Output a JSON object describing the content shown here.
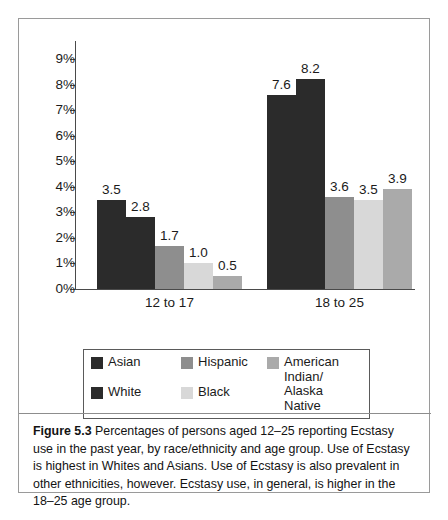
{
  "figure": {
    "caption_label": "Figure 5.3",
    "caption_text": " Percentages of persons aged 12–25 reporting Ecstasy use in the past year, by race/ethnicity and age group. Use of Ecstasy is highest in Whites and Asians. Use of Ecstasy is also prevalent in other ethnicities, however. Ecstasy use, in general, is higher in the 18–25 age group."
  },
  "chart_data": {
    "type": "bar",
    "title": "",
    "xlabel": "",
    "ylabel": "",
    "ylim": [
      0,
      9
    ],
    "ytick_labels": [
      "9%",
      "8%",
      "7%",
      "6%",
      "5%",
      "4%",
      "3%",
      "2%",
      "1%",
      "0%"
    ],
    "ytick_values": [
      9,
      8,
      7,
      6,
      5,
      4,
      3,
      2,
      1,
      0
    ],
    "grid": false,
    "legend_position": "bottom",
    "categories": [
      "12 to 17",
      "18 to 25"
    ],
    "series": [
      {
        "name": "Asian",
        "color": "#2b2b2b",
        "values": [
          3.5,
          7.6
        ],
        "labels": [
          "3.5",
          "7.6"
        ]
      },
      {
        "name": "White",
        "color": "#2b2b2b",
        "values": [
          2.8,
          8.2
        ],
        "labels": [
          "2.8",
          "8.2"
        ]
      },
      {
        "name": "Hispanic",
        "color": "#8e8e8e",
        "values": [
          1.7,
          3.6
        ],
        "labels": [
          "1.7",
          "3.6"
        ]
      },
      {
        "name": "Black",
        "color": "#d8d8d8",
        "values": [
          1.0,
          3.5
        ],
        "labels": [
          "1.0",
          "3.5"
        ]
      },
      {
        "name": "American Indian/\nAlaska Native",
        "color": "#aaaaaa",
        "values": [
          0.5,
          3.9
        ],
        "labels": [
          "0.5",
          "3.9"
        ]
      }
    ]
  },
  "legend": {
    "entries": [
      {
        "label": "Asian",
        "color": "#2b2b2b"
      },
      {
        "label": "Hispanic",
        "color": "#8e8e8e"
      },
      {
        "label": "American Indian/\nAlaska Native",
        "color": "#aaaaaa"
      },
      {
        "label": "White",
        "color": "#2b2b2b"
      },
      {
        "label": "Black",
        "color": "#d8d8d8"
      }
    ]
  }
}
